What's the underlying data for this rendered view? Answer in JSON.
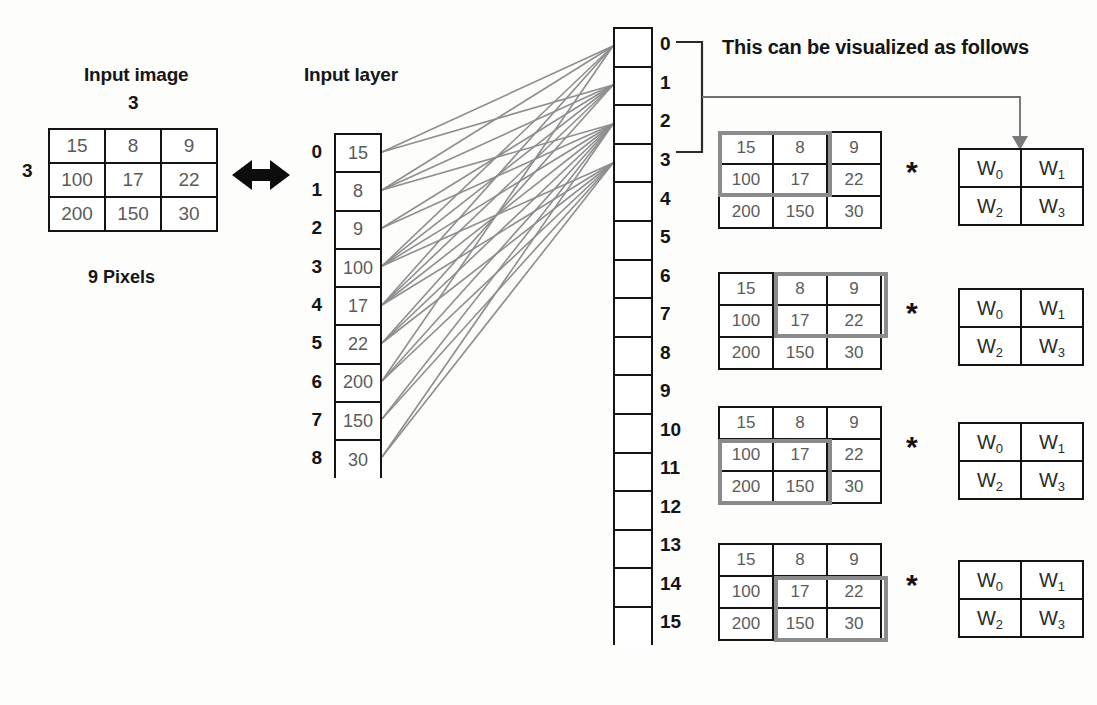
{
  "figure": {
    "left_section": {
      "title": "Input image",
      "top_dim": "3",
      "left_dim": "3",
      "caption": "9 Pixels",
      "matrix": [
        [
          "15",
          "8",
          "9"
        ],
        [
          "100",
          "17",
          "22"
        ],
        [
          "200",
          "150",
          "30"
        ]
      ]
    },
    "middle_section": {
      "title": "Input layer",
      "indices": [
        "0",
        "1",
        "2",
        "3",
        "4",
        "5",
        "6",
        "7",
        "8"
      ],
      "values": [
        "15",
        "8",
        "9",
        "100",
        "17",
        "22",
        "200",
        "150",
        "30"
      ]
    },
    "output_section": {
      "indices": [
        "0",
        "1",
        "2",
        "3",
        "4",
        "5",
        "6",
        "7",
        "8",
        "9",
        "10",
        "11",
        "12",
        "13",
        "14",
        "15"
      ],
      "values": [
        "",
        "",
        "",
        "",
        "",
        "",
        "",
        "",
        "",
        "",
        "",
        "",
        "",
        "",
        "",
        ""
      ],
      "bracket_from": "0",
      "bracket_to": "3"
    },
    "right_section": {
      "note": "This can be visualized as follows",
      "operator": "*",
      "kernel": [
        [
          "W",
          "0",
          "W",
          "1"
        ],
        [
          "W",
          "2",
          "W",
          "3"
        ]
      ],
      "kernel_labels": {
        "w0_base": "W",
        "w0_sub": "0",
        "w1_base": "W",
        "w1_sub": "1",
        "w2_base": "W",
        "w2_sub": "2",
        "w3_base": "W",
        "w3_sub": "3"
      },
      "matrix": [
        [
          "15",
          "8",
          "9"
        ],
        [
          "100",
          "17",
          "22"
        ],
        [
          "200",
          "150",
          "30"
        ]
      ],
      "windows": [
        {
          "name": "top-left",
          "row": 0,
          "col": 0
        },
        {
          "name": "top-right",
          "row": 0,
          "col": 1
        },
        {
          "name": "bottom-left",
          "row": 1,
          "col": 0
        },
        {
          "name": "bottom-right",
          "row": 1,
          "col": 1
        }
      ]
    },
    "colors": {
      "line": "#8e8e8e",
      "border": "#141414",
      "value_text": "#5b5b5b",
      "highlight": "#8b8b8b",
      "background": "#fdfdfc"
    }
  }
}
